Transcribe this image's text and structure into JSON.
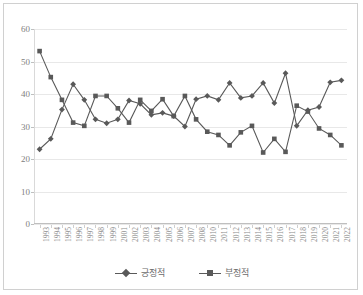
{
  "chart_data": {
    "type": "line",
    "title": "",
    "xlabel": "",
    "ylabel": "",
    "ylim": [
      0,
      60
    ],
    "ytick_values": [
      0,
      10,
      20,
      30,
      40,
      50,
      60
    ],
    "grid": true,
    "legend_position": "bottom",
    "categories": [
      "1993",
      "1994",
      "1995",
      "1996",
      "1997",
      "1998",
      "1999",
      "2001",
      "2002",
      "2003",
      "2004",
      "2005",
      "2006",
      "2007",
      "2008",
      "2010",
      "2011",
      "2012",
      "2013",
      "2014",
      "2015",
      "2016",
      "2017",
      "2018",
      "2019",
      "2020",
      "2021",
      "2022"
    ],
    "series": [
      {
        "name": "긍정적",
        "marker": "diamond",
        "color": "#595959",
        "values": [
          23.0,
          26.2,
          35.2,
          43.0,
          38.2,
          32.2,
          31.0,
          32.2,
          38.0,
          37.0,
          33.6,
          34.2,
          33.2,
          30.0,
          38.4,
          39.4,
          38.2,
          43.4,
          38.8,
          39.4,
          43.4,
          37.2,
          46.4,
          30.2,
          35.0,
          36.0,
          43.6,
          44.2
        ]
      },
      {
        "name": "부정적",
        "marker": "square",
        "color": "#595959",
        "values": [
          53.2,
          45.2,
          38.2,
          31.2,
          30.2,
          39.4,
          39.4,
          35.6,
          31.2,
          38.2,
          34.8,
          38.4,
          33.2,
          39.4,
          32.2,
          28.4,
          27.4,
          24.2,
          28.2,
          30.2,
          22.0,
          26.2,
          22.2,
          36.4,
          34.6,
          29.4,
          27.4,
          24.2
        ]
      }
    ]
  },
  "legend": {
    "entries": [
      {
        "label": "긍정적",
        "marker": "diamond"
      },
      {
        "label": "부정적",
        "marker": "square"
      }
    ]
  }
}
